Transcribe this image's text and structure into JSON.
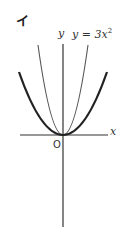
{
  "figure": {
    "panel_label": "イ",
    "y_axis_label": "y",
    "x_axis_label": "x",
    "origin_label": "O",
    "curve_label_lhs": "y = 3x",
    "curve_label_exp": "2",
    "colors": {
      "axis": "#333333",
      "thin_curve": "#555555",
      "thick_curve": "#222222",
      "background": "#ffffff"
    }
  },
  "curves": [
    {
      "name": "y = 3x^2",
      "style": "thin",
      "labeled": true
    },
    {
      "name": "unlabeled wider parabola",
      "style": "thick",
      "labeled": false
    }
  ]
}
